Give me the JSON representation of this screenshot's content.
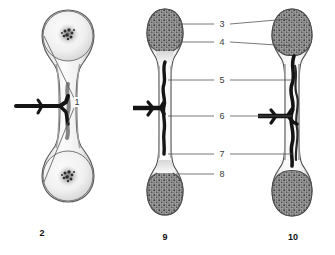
{
  "figure": {
    "title": "",
    "background_color": "#ffffff",
    "panels": [
      {
        "id": "panel-2",
        "label": "2",
        "description": "cartilage model with primary ossification center"
      },
      {
        "id": "panel-9",
        "label": "9",
        "description": "developing long bone with epiphyses and diaphysis"
      },
      {
        "id": "panel-10",
        "label": "10",
        "description": "mature long bone with extensive vasculature"
      }
    ],
    "callouts": [
      {
        "id": "callout-1",
        "label": "1",
        "x": 77,
        "y": 102
      },
      {
        "id": "callout-3",
        "label": "3",
        "x": 222,
        "y": 24
      },
      {
        "id": "callout-4",
        "label": "4",
        "x": 222,
        "y": 42
      },
      {
        "id": "callout-5",
        "label": "5",
        "x": 222,
        "y": 80
      },
      {
        "id": "callout-6",
        "label": "6",
        "x": 222,
        "y": 116
      },
      {
        "id": "callout-7",
        "label": "7",
        "x": 222,
        "y": 154
      },
      {
        "id": "callout-8",
        "label": "8",
        "x": 222,
        "y": 174
      }
    ],
    "panel_labels": [
      {
        "id": "panel-label-2",
        "label": "2",
        "x": 42,
        "y": 228
      },
      {
        "id": "panel-label-9",
        "label": "9",
        "x": 165,
        "y": 232
      },
      {
        "id": "panel-label-10",
        "label": "10",
        "x": 293,
        "y": 232
      }
    ],
    "colors": {
      "bone_outline": "#4a4a4a",
      "bone_fill_light": "#f2f2f2",
      "bone_fill_shade": "#c9c9c9",
      "cortex_gray": "#a8a8a8",
      "spongy_gray": "#8c8c8c",
      "vessel_dark": "#1a1a1a",
      "leader_line": "#555555",
      "label_text": "#3a3a3a",
      "panel_label_text": "#111111"
    }
  }
}
